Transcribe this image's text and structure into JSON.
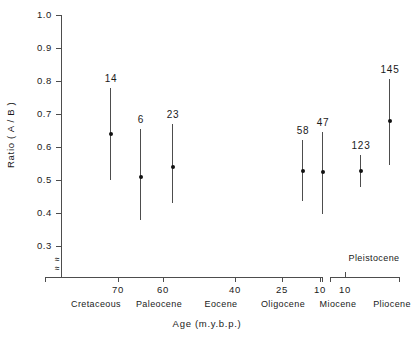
{
  "chart_data": {
    "type": "scatter",
    "title": "",
    "xlabel": "Age (m.y.b.p.)",
    "ylabel": "Ratio ( A / B )",
    "ylim": [
      0.3,
      1.0
    ],
    "yticks": [
      "1.0",
      "0.9",
      "0.8",
      "0.7",
      "0.6",
      "0.5",
      "0.4",
      "0.3"
    ],
    "ytick_values": [
      1.0,
      0.9,
      0.8,
      0.7,
      0.6,
      0.5,
      0.4,
      0.3
    ],
    "y_axis_break": true,
    "y_axis_break_symbol": "≈",
    "xticks": [
      "70",
      "60",
      "40",
      "25",
      "10",
      "10"
    ],
    "xtick_values": [
      70,
      60,
      40,
      25,
      10,
      10
    ],
    "grid": false,
    "legend": "none",
    "era_labels": [
      "Cretaceous",
      "Paleocene",
      "Eocene",
      "Oligocene",
      "Miocene",
      "Pliocene",
      "Recent"
    ],
    "bracket_label": "Pleistocene",
    "points": [
      {
        "label": "14",
        "value": 0.64,
        "low": 0.5,
        "high": 0.78,
        "era": "Cretaceous"
      },
      {
        "label": "6",
        "value": 0.51,
        "low": 0.38,
        "high": 0.655,
        "era": "Paleocene"
      },
      {
        "label": "23",
        "value": 0.54,
        "low": 0.43,
        "high": 0.67,
        "era": "Eocene"
      },
      {
        "label": "58",
        "value": 0.528,
        "low": 0.435,
        "high": 0.62,
        "era": "Miocene"
      },
      {
        "label": "47",
        "value": 0.523,
        "low": 0.398,
        "high": 0.645,
        "era": "Pliocene"
      },
      {
        "label": "123",
        "value": 0.528,
        "low": 0.478,
        "high": 0.575,
        "era": "Pleistocene"
      },
      {
        "label": "145",
        "value": 0.678,
        "low": 0.545,
        "high": 0.805,
        "era": "Recent"
      }
    ],
    "colors": {
      "axis": "#4d4d4d",
      "marker": "#111111",
      "errorbar": "#4d4d4d",
      "text": "#1a1a1a",
      "background": "#ffffff"
    }
  },
  "layout": {
    "y_top_px": 15,
    "y_bottom_px": 246,
    "y_top_val": 1.0,
    "y_bottom_val": 0.3,
    "xtick_px": [
      118,
      163,
      235,
      282,
      320,
      345
    ],
    "era_px": [
      96,
      159,
      221,
      283,
      338,
      392,
      468
    ],
    "point_px": [
      110,
      140,
      172,
      302,
      322,
      360,
      389
    ],
    "pleistocene_label_px": 374
  }
}
